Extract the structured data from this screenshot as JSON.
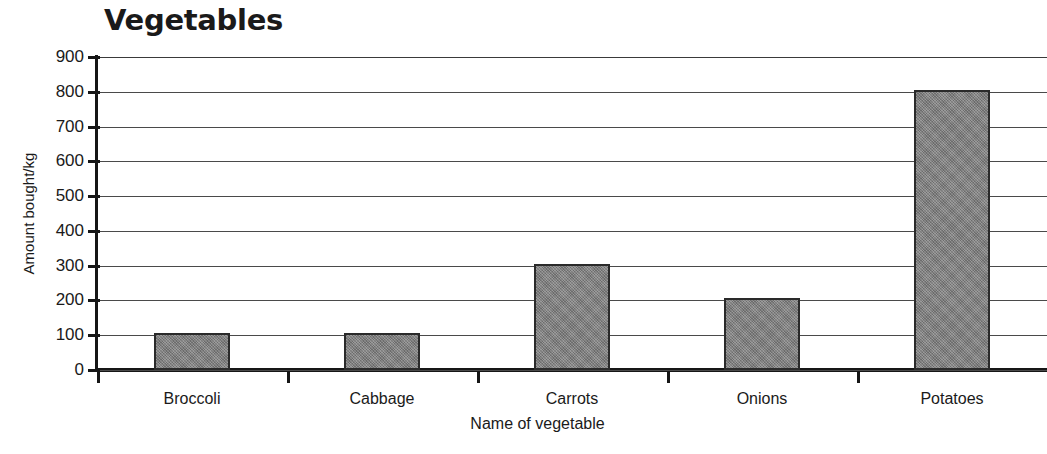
{
  "chart_data": {
    "type": "bar",
    "title": "Vegetables",
    "xlabel": "Name of vegetable",
    "ylabel": "Amount bought/kg",
    "categories": [
      "Broccoli",
      "Cabbage",
      "Carrots",
      "Onions",
      "Potatoes"
    ],
    "values": [
      105,
      105,
      305,
      207,
      805
    ],
    "ylim": [
      0,
      900
    ],
    "ytick_step": 100,
    "ytick_labels": [
      "900",
      "800",
      "700",
      "600",
      "500",
      "400",
      "300",
      "200",
      "100",
      "0"
    ],
    "ytick_values": [
      900,
      800,
      700,
      600,
      500,
      400,
      300,
      200,
      100,
      0
    ],
    "grid": true,
    "legend": false,
    "bar_color": "#818181",
    "bar_edge_color": "#2a2a2a",
    "axis_color": "#161616",
    "grid_color": "#4a4a4a",
    "background": "#ffffff"
  }
}
